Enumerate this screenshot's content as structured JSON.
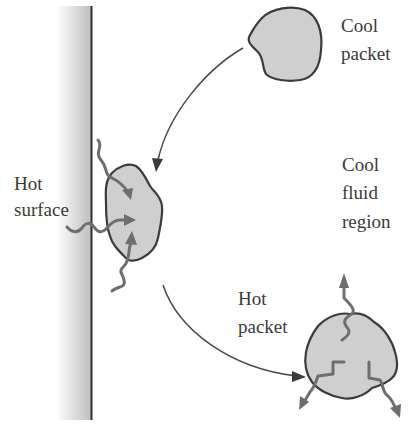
{
  "diagram": {
    "colors": {
      "background": "#ffffff",
      "packet_fill": "#cfcfcf",
      "outline": "#3b3b3b",
      "heat_arrow": "#6e6e6e",
      "wall_gradient_dark": "#bdbdbd",
      "wall_gradient_light": "#ffffff",
      "text": "#3a3a3a"
    },
    "labels": {
      "hot_surface": {
        "line1": "Hot",
        "line2": "surface"
      },
      "cool_packet": {
        "line1": "Cool",
        "line2": "packet"
      },
      "cool_fluid_region": {
        "line1": "Cool",
        "line2": "fluid",
        "line3": "region"
      },
      "hot_packet": {
        "line1": "Hot",
        "line2": "packet"
      }
    },
    "elements": [
      {
        "id": "hot-surface-wall",
        "description": "Vertical shaded wall with dark boundary line on right"
      },
      {
        "id": "cool-packet",
        "description": "Gray fluid blob at top right"
      },
      {
        "id": "packet-at-wall",
        "description": "Gray fluid blob touching wall, receiving 3 wavy heat arrows from the wall"
      },
      {
        "id": "hot-packet",
        "description": "Gray fluid blob at bottom right emitting 3 wavy heat arrows outward"
      },
      {
        "id": "arrow-cool-to-wall",
        "description": "Curved arrow from cool packet down to wall packet"
      },
      {
        "id": "arrow-wall-to-hot",
        "description": "Curved arrow from wall packet down to hot packet"
      }
    ]
  }
}
